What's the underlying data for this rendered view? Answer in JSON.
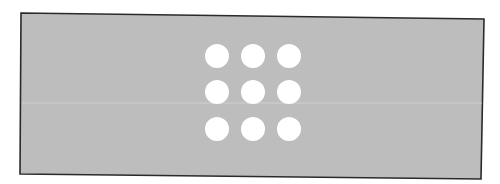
{
  "figure": {
    "panel": {
      "fill": "#bdbdbd",
      "stroke": "#2a2a2a",
      "corners": {
        "top_left": [
          21,
          13
        ],
        "top_right": [
          484,
          19
        ],
        "bottom_right": [
          481,
          179
        ],
        "bottom_left": [
          20,
          174
        ]
      }
    },
    "dot_grid": {
      "rows": 3,
      "cols": 3,
      "fill": "#ffffff",
      "radius": 12,
      "x_centers": [
        217,
        253,
        289
      ],
      "y_centers": [
        56,
        92,
        129
      ]
    },
    "scan_line": {
      "y": 103,
      "color": "#d4d4d4"
    }
  }
}
